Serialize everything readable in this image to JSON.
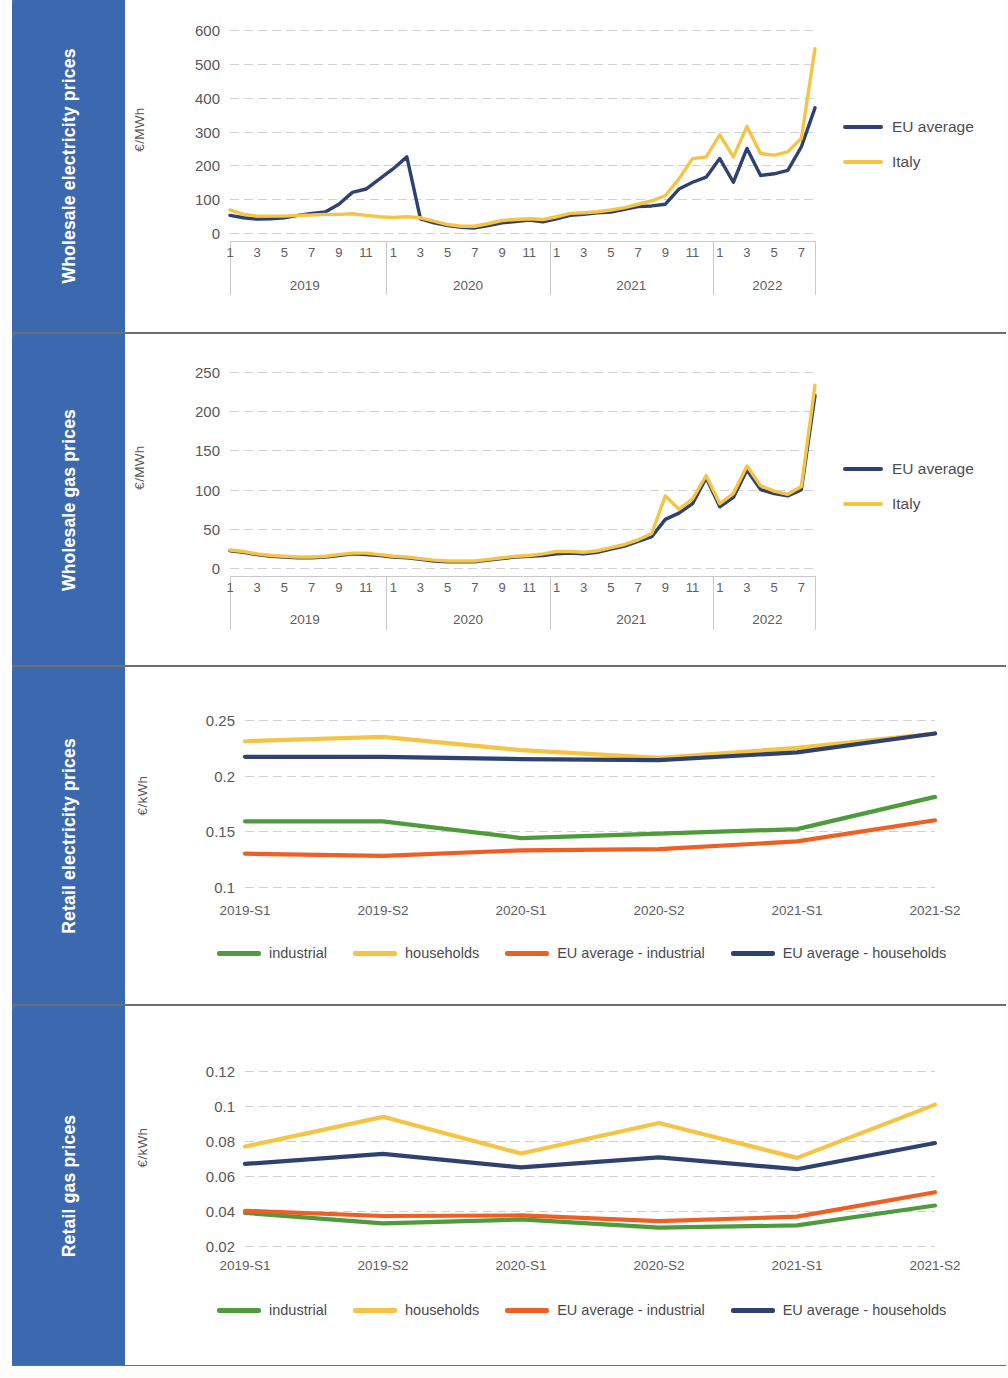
{
  "panels": [
    {
      "sidebar_label": "Wholesale electricity prices"
    },
    {
      "sidebar_label": "Wholesale gas prices"
    },
    {
      "sidebar_label": "Retail electricity prices"
    },
    {
      "sidebar_label": "Retail gas prices"
    }
  ],
  "colors": {
    "sidebar_blue": "#3d6cb4",
    "eu_navy": "#2e4272",
    "italy_yellow": "#f6c445",
    "industrial_green": "#4e9b3c",
    "households_yellow": "#f6c445",
    "eu_industrial_orange": "#ef5f24",
    "eu_households_navy": "#2e4272",
    "grid_grey": "#aaaaaf",
    "axis_grey": "#c9c9cc",
    "text_grey": "#58585a"
  },
  "chart_data": [
    {
      "id": "wholesale-electricity",
      "type": "line",
      "title": "Wholesale electricity prices",
      "xlabel": "",
      "ylabel": "€/MWh",
      "ylim": [
        0,
        600
      ],
      "yticks": [
        0,
        100,
        200,
        300,
        400,
        500,
        600
      ],
      "grid": true,
      "legend_position": "right",
      "x_groups": [
        "2019",
        "2020",
        "2021",
        "2022"
      ],
      "x_ticks_per_group": [
        [
          "1",
          "3",
          "5",
          "7",
          "9",
          "11"
        ],
        [
          "1",
          "3",
          "5",
          "7",
          "9",
          "11"
        ],
        [
          "1",
          "3",
          "5",
          "7",
          "9",
          "11"
        ],
        [
          "1",
          "3",
          "5",
          "7"
        ]
      ],
      "x": [
        "2019-01",
        "2019-02",
        "2019-03",
        "2019-04",
        "2019-05",
        "2019-06",
        "2019-07",
        "2019-08",
        "2019-09",
        "2019-10",
        "2019-11",
        "2019-12",
        "2020-01",
        "2020-02",
        "2020-03",
        "2020-04",
        "2020-05",
        "2020-06",
        "2020-07",
        "2020-08",
        "2020-09",
        "2020-10",
        "2020-11",
        "2020-12",
        "2021-01",
        "2021-02",
        "2021-03",
        "2021-04",
        "2021-05",
        "2021-06",
        "2021-07",
        "2021-08",
        "2021-09",
        "2021-10",
        "2021-11",
        "2021-12",
        "2022-01",
        "2022-02",
        "2022-03",
        "2022-04",
        "2022-05",
        "2022-06",
        "2022-07",
        "2022-08"
      ],
      "series": [
        {
          "name": "EU average",
          "color": "#2e4272",
          "values": [
            52,
            45,
            41,
            42,
            45,
            52,
            58,
            62,
            85,
            120,
            130,
            160,
            190,
            225,
            42,
            30,
            22,
            17,
            15,
            22,
            30,
            34,
            38,
            33,
            42,
            52,
            55,
            60,
            62,
            70,
            78,
            80,
            85,
            130,
            150,
            165,
            220,
            150,
            250,
            170,
            175,
            185,
            255,
            370
          ]
        },
        {
          "name": "Italy",
          "color": "#f6c445",
          "values": [
            68,
            55,
            50,
            50,
            50,
            52,
            53,
            55,
            55,
            57,
            52,
            48,
            46,
            48,
            45,
            35,
            25,
            20,
            20,
            28,
            37,
            40,
            42,
            40,
            48,
            58,
            60,
            63,
            68,
            75,
            85,
            95,
            110,
            160,
            220,
            225,
            290,
            225,
            315,
            235,
            230,
            240,
            280,
            545
          ]
        }
      ]
    },
    {
      "id": "wholesale-gas",
      "type": "line",
      "title": "Wholesale gas prices",
      "xlabel": "",
      "ylabel": "€/MWh",
      "ylim": [
        0,
        250
      ],
      "yticks": [
        0,
        50,
        100,
        150,
        200,
        250
      ],
      "grid": true,
      "legend_position": "right",
      "x_groups": [
        "2019",
        "2020",
        "2021",
        "2022"
      ],
      "x_ticks_per_group": [
        [
          "1",
          "3",
          "5",
          "7",
          "9",
          "11"
        ],
        [
          "1",
          "3",
          "5",
          "7",
          "9",
          "11"
        ],
        [
          "1",
          "3",
          "5",
          "7",
          "9",
          "11"
        ],
        [
          "1",
          "3",
          "5",
          "7"
        ]
      ],
      "x": [
        "2019-01",
        "2019-02",
        "2019-03",
        "2019-04",
        "2019-05",
        "2019-06",
        "2019-07",
        "2019-08",
        "2019-09",
        "2019-10",
        "2019-11",
        "2019-12",
        "2020-01",
        "2020-02",
        "2020-03",
        "2020-04",
        "2020-05",
        "2020-06",
        "2020-07",
        "2020-08",
        "2020-09",
        "2020-10",
        "2020-11",
        "2020-12",
        "2021-01",
        "2021-02",
        "2021-03",
        "2021-04",
        "2021-05",
        "2021-06",
        "2021-07",
        "2021-08",
        "2021-09",
        "2021-10",
        "2021-11",
        "2021-12",
        "2022-01",
        "2022-02",
        "2022-03",
        "2022-04",
        "2022-05",
        "2022-06",
        "2022-07",
        "2022-08"
      ],
      "series": [
        {
          "name": "EU average",
          "color": "#2e4272",
          "values": [
            22,
            20,
            17,
            15,
            14,
            13,
            13,
            14,
            16,
            18,
            17,
            16,
            14,
            13,
            11,
            9,
            8,
            8,
            8,
            10,
            12,
            14,
            15,
            16,
            18,
            19,
            18,
            20,
            24,
            28,
            34,
            40,
            62,
            70,
            82,
            115,
            78,
            90,
            125,
            100,
            95,
            92,
            100,
            220
          ]
        },
        {
          "name": "Italy",
          "color": "#f6c445",
          "values": [
            23,
            21,
            18,
            16,
            15,
            14,
            14,
            15,
            17,
            19,
            19,
            17,
            15,
            14,
            12,
            10,
            9,
            9,
            9,
            11,
            13,
            15,
            16,
            18,
            21,
            21,
            20,
            22,
            26,
            30,
            36,
            44,
            92,
            75,
            88,
            118,
            82,
            95,
            130,
            105,
            98,
            94,
            104,
            233
          ]
        }
      ]
    },
    {
      "id": "retail-electricity",
      "type": "line",
      "title": "Retail electricity prices",
      "xlabel": "",
      "ylabel": "€/kWh",
      "ylim": [
        0.1,
        0.26
      ],
      "yticks": [
        0.1,
        0.15,
        0.2,
        0.25
      ],
      "ytick_labels": [
        "0.1",
        "0.15",
        "0.2",
        "0.25"
      ],
      "grid": true,
      "legend_position": "bottom",
      "categories": [
        "2019-S1",
        "2019-S2",
        "2020-S1",
        "2020-S2",
        "2021-S1",
        "2021-S2"
      ],
      "series": [
        {
          "name": "industrial",
          "color": "#4e9b3c",
          "values": [
            0.159,
            0.159,
            0.144,
            0.148,
            0.152,
            0.181
          ]
        },
        {
          "name": "households",
          "color": "#f6c445",
          "values": [
            0.231,
            0.235,
            0.223,
            0.216,
            0.225,
            0.238
          ]
        },
        {
          "name": "EU average - industrial",
          "color": "#ef5f24",
          "values": [
            0.13,
            0.128,
            0.133,
            0.134,
            0.141,
            0.16
          ]
        },
        {
          "name": "EU average - households",
          "color": "#2e4272",
          "values": [
            0.217,
            0.217,
            0.215,
            0.214,
            0.221,
            0.238
          ]
        }
      ]
    },
    {
      "id": "retail-gas",
      "type": "line",
      "title": "Retail gas prices",
      "xlabel": "",
      "ylabel": "€/kWh",
      "ylim": [
        0.02,
        0.13
      ],
      "yticks": [
        0.02,
        0.04,
        0.06,
        0.08,
        0.1,
        0.12
      ],
      "ytick_labels": [
        "0.02",
        "0.04",
        "0.06",
        "0.08",
        "0.1",
        "0.12"
      ],
      "grid": true,
      "legend_position": "bottom",
      "categories": [
        "2019-S1",
        "2019-S2",
        "2020-S1",
        "2020-S2",
        "2021-S1",
        "2021-S2"
      ],
      "series": [
        {
          "name": "industrial",
          "color": "#4e9b3c",
          "values": [
            0.039,
            0.033,
            0.0352,
            0.0305,
            0.0318,
            0.0432
          ]
        },
        {
          "name": "households",
          "color": "#f6c445",
          "values": [
            0.077,
            0.094,
            0.073,
            0.0905,
            0.0705,
            0.101
          ]
        },
        {
          "name": "EU average - industrial",
          "color": "#ef5f24",
          "values": [
            0.0402,
            0.0372,
            0.0375,
            0.0342,
            0.0368,
            0.0508
          ]
        },
        {
          "name": "EU average - households",
          "color": "#2e4272",
          "values": [
            0.067,
            0.0728,
            0.065,
            0.0708,
            0.064,
            0.079
          ]
        }
      ]
    }
  ]
}
